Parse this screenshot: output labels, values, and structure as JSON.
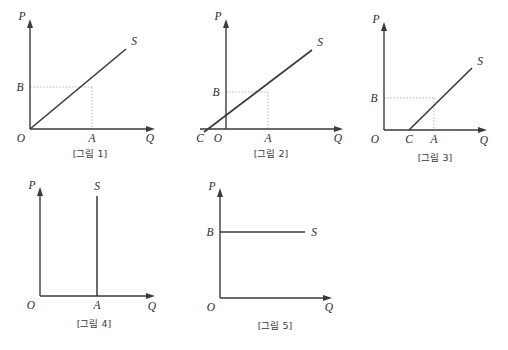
{
  "page": {
    "background_color": "#ffffff",
    "line_color": "#3a3a3a",
    "dotted_color": "#b9b9b9",
    "text_color": "#2b2b2b"
  },
  "figures": [
    {
      "id": "figure-1",
      "caption": "[그림 1]",
      "axis_y_label": "P",
      "axis_x_label": "Q",
      "origin_label": "O",
      "curve_label": "S",
      "point_labels": {
        "x_point": "A",
        "y_point": "B",
        "intercept": ""
      },
      "description": "Supply curve S through origin; dotted guide lines from B on P-axis and A on Q-axis meet on the curve.",
      "supply_type": "linear-through-origin"
    },
    {
      "id": "figure-2",
      "caption": "[그림 2]",
      "axis_y_label": "P",
      "axis_x_label": "Q",
      "origin_label": "O",
      "curve_label": "S",
      "point_labels": {
        "x_point": "A",
        "y_point": "B",
        "intercept": "C"
      },
      "description": "Supply curve S with positive price intercept, crossing Q-axis at C left of O; dotted guides from B and A.",
      "supply_type": "linear-positive-intercept"
    },
    {
      "id": "figure-3",
      "caption": "[그림 3]",
      "axis_y_label": "P",
      "axis_x_label": "Q",
      "origin_label": "O",
      "curve_label": "S",
      "point_labels": {
        "x_point": "A",
        "y_point": "B",
        "intercept": "C"
      },
      "description": "Supply curve S starting on Q-axis at C right of O; dotted guides from B and A.",
      "supply_type": "linear-negative-intercept"
    },
    {
      "id": "figure-4",
      "caption": "[그림 4]",
      "axis_y_label": "P",
      "axis_x_label": "Q",
      "origin_label": "O",
      "curve_label": "S",
      "point_labels": {
        "x_point": "A",
        "y_point": "",
        "intercept": ""
      },
      "description": "Perfectly inelastic vertical supply curve S at quantity A.",
      "supply_type": "vertical"
    },
    {
      "id": "figure-5",
      "caption": "[그림 5]",
      "axis_y_label": "P",
      "axis_x_label": "Q",
      "origin_label": "O",
      "curve_label": "S",
      "point_labels": {
        "x_point": "",
        "y_point": "B",
        "intercept": ""
      },
      "description": "Perfectly elastic horizontal supply curve S at price B.",
      "supply_type": "horizontal"
    }
  ]
}
